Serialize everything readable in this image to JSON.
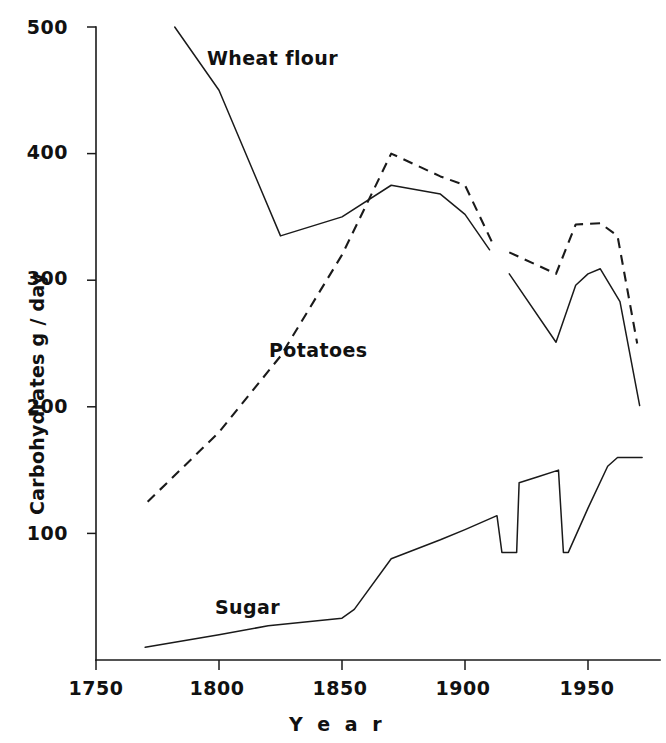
{
  "chart_data": {
    "type": "line",
    "title": "",
    "xlabel": "Year",
    "ylabel": "Carbohydrates  g / day",
    "xlim": [
      1750,
      1975
    ],
    "ylim": [
      0,
      500
    ],
    "xticks": [
      1750,
      1800,
      1850,
      1900,
      1950
    ],
    "yticks": [
      100,
      200,
      300,
      400,
      500
    ],
    "grid": false,
    "legend_position": "inline-annotations",
    "series": [
      {
        "name": "Wheat flour",
        "style": "solid",
        "label_text": "Wheat flour",
        "segments": [
          {
            "points": [
              [
                1782,
                500
              ],
              [
                1800,
                450
              ],
              [
                1825,
                335
              ],
              [
                1850,
                350
              ],
              [
                1870,
                375
              ],
              [
                1890,
                368
              ],
              [
                1900,
                352
              ],
              [
                1910,
                324
              ]
            ]
          },
          {
            "points": [
              [
                1918,
                305
              ],
              [
                1937,
                251
              ],
              [
                1945,
                296
              ],
              [
                1950,
                305
              ],
              [
                1955,
                309
              ],
              [
                1963,
                283
              ],
              [
                1971,
                201
              ]
            ]
          }
        ]
      },
      {
        "name": "Potatoes",
        "style": "dashed",
        "label_text": "Potatoes",
        "segments": [
          {
            "points": [
              [
                1771,
                125
              ],
              [
                1800,
                180
              ],
              [
                1825,
                240
              ],
              [
                1850,
                320
              ],
              [
                1870,
                400
              ],
              [
                1890,
                382
              ],
              [
                1900,
                375
              ],
              [
                1911,
                330
              ]
            ]
          },
          {
            "points": [
              [
                1918,
                322
              ],
              [
                1937,
                305
              ],
              [
                1945,
                344
              ],
              [
                1955,
                345
              ],
              [
                1962,
                335
              ],
              [
                1970,
                250
              ]
            ]
          }
        ]
      },
      {
        "name": "Sugar",
        "style": "solid",
        "label_text": "Sugar",
        "segments": [
          {
            "points": [
              [
                1770,
                10
              ],
              [
                1800,
                20
              ],
              [
                1820,
                27
              ],
              [
                1850,
                33
              ],
              [
                1855,
                40
              ],
              [
                1870,
                80
              ],
              [
                1890,
                95
              ],
              [
                1900,
                103
              ],
              [
                1913,
                114
              ],
              [
                1915,
                85
              ],
              [
                1921,
                85
              ],
              [
                1922,
                140
              ],
              [
                1930,
                145
              ],
              [
                1938,
                150
              ],
              [
                1940,
                85
              ],
              [
                1942,
                85
              ],
              [
                1950,
                120
              ],
              [
                1958,
                153
              ],
              [
                1962,
                160
              ],
              [
                1972,
                160
              ]
            ]
          }
        ]
      }
    ],
    "annotations": [
      {
        "text": "Wheat flour",
        "x": 1796,
        "y": 452,
        "series": "Wheat flour"
      },
      {
        "text": "Potatoes",
        "x": 1821,
        "y": 243,
        "series": "Potatoes"
      },
      {
        "text": "Sugar",
        "x": 1810,
        "y": 47,
        "series": "Sugar"
      }
    ]
  },
  "axes": {
    "y_tick_labels": [
      "500",
      "400",
      "300",
      "200",
      "100"
    ],
    "x_tick_labels": [
      "1750",
      "1800",
      "1850",
      "1900",
      "1950"
    ],
    "y_axis_title": "Carbohydrates  g / day",
    "x_axis_title": "Y e a r"
  },
  "colors": {
    "ink": "#1a1a1a",
    "background": "#ffffff"
  }
}
